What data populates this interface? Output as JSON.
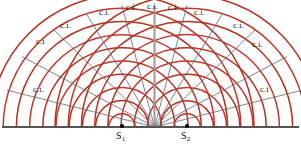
{
  "figure": {
    "type": "wave-interference-diagram",
    "width": 301,
    "height": 150,
    "background": "#ffffff"
  },
  "colors": {
    "wavefront": "#c0392b",
    "wavefront_alt": "#b5321f",
    "antinodal_line": "#5c6670",
    "baseline": "#555555",
    "center_line": "#9a9a9a",
    "source_dot": "#000000",
    "text": "#141414"
  },
  "baseline": {
    "y": 127,
    "x_start": 2,
    "x_end": 299,
    "thickness": 2.2
  },
  "center_line": {
    "x": 154.5,
    "y_top": 6,
    "y_bottom": 127,
    "thickness": 2.0
  },
  "sources": [
    {
      "id": "s1",
      "label": "S",
      "subscript": "1",
      "x": 122,
      "y": 127,
      "label_x": 116,
      "label_y": 131,
      "arcs": 10
    },
    {
      "id": "s2",
      "label": "S",
      "subscript": "2",
      "x": 187,
      "y": 127,
      "label_x": 181,
      "label_y": 131,
      "arcs": 10
    }
  ],
  "arc_spacing": 13.2,
  "arc_first_radius": 13.2,
  "antinodal_lines": [
    {
      "id": "n-left-5",
      "angle_deg": -76,
      "length": 152
    },
    {
      "id": "n-left-4",
      "angle_deg": -62,
      "length": 150
    },
    {
      "id": "n-left-3",
      "angle_deg": -46,
      "length": 140
    },
    {
      "id": "n-left-2",
      "angle_deg": -31,
      "length": 132
    },
    {
      "id": "n-left-1",
      "angle_deg": -15,
      "length": 126
    },
    {
      "id": "n-center-0",
      "angle_deg": 0,
      "length": 122
    },
    {
      "id": "n-right-1",
      "angle_deg": 15,
      "length": 126
    },
    {
      "id": "n-right-2",
      "angle_deg": 31,
      "length": 132
    },
    {
      "id": "n-right-3",
      "angle_deg": 46,
      "length": 140
    },
    {
      "id": "n-right-4",
      "angle_deg": 62,
      "length": 150
    },
    {
      "id": "n-right-5",
      "angle_deg": 76,
      "length": 152
    }
  ],
  "labels": {
    "constructive_interference": "c.i.",
    "items": [
      {
        "id": "ci-left-5",
        "text": "c.i.",
        "x": 33,
        "y": 85
      },
      {
        "id": "ci-left-4",
        "text": "c.i",
        "x": 36,
        "y": 37
      },
      {
        "id": "ci-left-3",
        "text": "c.i.",
        "x": 60,
        "y": 21
      },
      {
        "id": "ci-left-2",
        "text": "c.i.",
        "x": 99,
        "y": 8
      },
      {
        "id": "ci-left-1",
        "text": "c.i.",
        "x": 126,
        "y": 3
      },
      {
        "id": "ci-center",
        "text": "c.i.",
        "x": 147,
        "y": 2
      },
      {
        "id": "ci-right-1",
        "text": "c.i.",
        "x": 168,
        "y": 3
      },
      {
        "id": "ci-right-2",
        "text": "c.i.",
        "x": 194,
        "y": 8
      },
      {
        "id": "ci-right-3",
        "text": "c.i.",
        "x": 233,
        "y": 21
      },
      {
        "id": "ci-right-4",
        "text": "c.i.",
        "x": 252,
        "y": 40
      },
      {
        "id": "ci-right-5",
        "text": "c.i",
        "x": 260,
        "y": 85
      }
    ]
  }
}
